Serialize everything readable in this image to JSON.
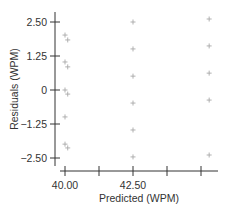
{
  "chart_data": {
    "type": "scatter",
    "title": "",
    "xlabel": "Predicted (WPM)",
    "ylabel": "Residuals (WPM)",
    "xlim": [
      39.7,
      46.5
    ],
    "ylim": [
      -2.7,
      2.8
    ],
    "x_ticks": [
      40.0,
      41.25,
      42.5,
      43.75,
      45.0
    ],
    "x_tick_labels": [
      "40.00",
      "",
      "42.50",
      "",
      ""
    ],
    "y_ticks": [
      2.5,
      1.25,
      0,
      -1.25,
      -2.5
    ],
    "y_tick_labels": [
      "2.50",
      "1.25",
      "0",
      "-1.25",
      "-2.50"
    ],
    "grid": false,
    "legend": null,
    "marker": "plus",
    "marker_color": "#a8a8a8",
    "series": [
      {
        "name": "Residuals",
        "points": [
          {
            "x": 40.0,
            "y": 2.02
          },
          {
            "x": 40.1,
            "y": 1.84
          },
          {
            "x": 40.0,
            "y": 1.03
          },
          {
            "x": 40.1,
            "y": 0.85
          },
          {
            "x": 40.0,
            "y": 0.0
          },
          {
            "x": 40.1,
            "y": -0.15
          },
          {
            "x": 40.0,
            "y": -0.99
          },
          {
            "x": 40.0,
            "y": -1.99
          },
          {
            "x": 40.1,
            "y": -2.13
          },
          {
            "x": 42.5,
            "y": 2.5
          },
          {
            "x": 42.5,
            "y": 1.51
          },
          {
            "x": 42.5,
            "y": 0.51
          },
          {
            "x": 42.5,
            "y": -0.48
          },
          {
            "x": 42.5,
            "y": -1.47
          },
          {
            "x": 42.5,
            "y": -2.46
          },
          {
            "x": 45.3,
            "y": 2.61
          },
          {
            "x": 45.3,
            "y": 1.62
          },
          {
            "x": 45.3,
            "y": 0.62
          },
          {
            "x": 45.3,
            "y": -0.37
          },
          {
            "x": 45.3,
            "y": -2.39
          }
        ]
      }
    ]
  }
}
